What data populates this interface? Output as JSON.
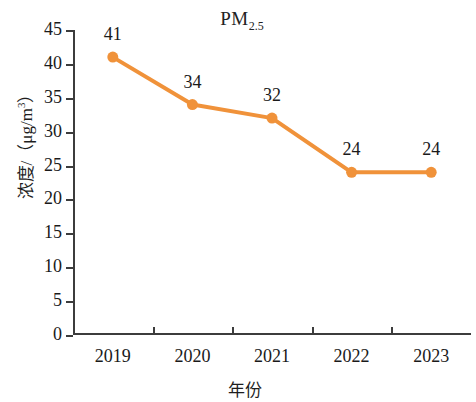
{
  "chart_data": {
    "type": "line",
    "title": "PM2.5",
    "title_main": "PM",
    "title_sub": "2.5",
    "xlabel": "年份",
    "ylabel": "浓度/（μg/m³）",
    "ylabel_main": "浓度/（μg/m",
    "ylabel_sup": "3",
    "ylabel_tail": "）",
    "categories": [
      "2019",
      "2020",
      "2021",
      "2022",
      "2023"
    ],
    "values": [
      41,
      34,
      32,
      24,
      24
    ],
    "point_labels": [
      "41",
      "34",
      "32",
      "24",
      "24"
    ],
    "ylim": [
      0,
      45
    ],
    "ytick_values": [
      0,
      5,
      10,
      15,
      20,
      25,
      30,
      35,
      40,
      45
    ],
    "ytick_labels": [
      "0",
      "5",
      "10",
      "15",
      "20",
      "25",
      "30",
      "35",
      "40",
      "45"
    ],
    "grid": false,
    "legend": false,
    "series_color": "#F0923A",
    "axis_color": "#3C3C3C",
    "text_color": "#1A1A1A",
    "background": "#FFFFFF",
    "marker": "circle",
    "series": [
      {
        "name": "PM2.5",
        "values": [
          41,
          34,
          32,
          24,
          24
        ]
      }
    ]
  }
}
